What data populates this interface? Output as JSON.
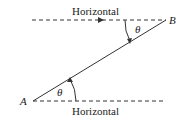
{
  "diagram": {
    "top_line_label": "Horizontal",
    "bottom_line_label": "Horizontal",
    "point_a": "A",
    "point_b": "B",
    "angle_top": "θ",
    "angle_bottom": "θ"
  }
}
